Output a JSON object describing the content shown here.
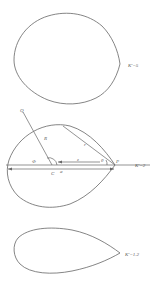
{
  "figure": {
    "panels": [
      {
        "id": "top",
        "label": "K'=5",
        "shape": "near-circular limaçon with cusp at right"
      },
      {
        "id": "middle",
        "label": "K'=2",
        "shape": "teardrop with construction lines"
      },
      {
        "id": "bottom",
        "label": "K'=1.2",
        "shape": "elongated teardrop"
      }
    ],
    "middle_labels": {
      "Q": "Q",
      "R": "R",
      "phi": "Φ",
      "r": "r",
      "z": "z̄",
      "theta": "θ",
      "P": "P",
      "C": "C",
      "a": "a"
    },
    "colors": {
      "stroke": "#666666",
      "text": "#555555",
      "background": "#ffffff"
    }
  }
}
